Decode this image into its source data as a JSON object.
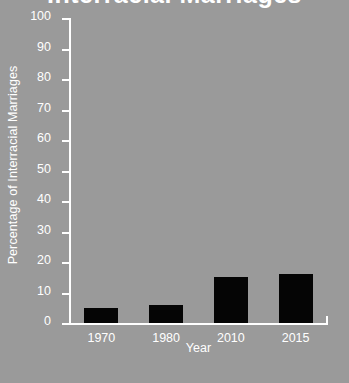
{
  "chart_data": {
    "type": "bar",
    "title": "Interracial Marriages",
    "xlabel": "Year",
    "ylabel": "Percentage of Interracial Marriages",
    "categories": [
      "1970",
      "1980",
      "2010",
      "2015"
    ],
    "values": [
      5,
      6,
      15,
      16
    ],
    "ylim": [
      0,
      100
    ],
    "ytick_labels": [
      "100",
      "90",
      "80",
      "70",
      "60",
      "50",
      "40",
      "30",
      "20",
      "10",
      "0"
    ],
    "ytick_values": [
      100,
      90,
      80,
      70,
      60,
      50,
      40,
      30,
      20,
      10,
      0
    ],
    "grid": false,
    "legend": "none",
    "colors": {
      "background": "#9a9a9a",
      "bar": "#050505",
      "axis": "#ffffff",
      "text": "#ffffff"
    }
  }
}
